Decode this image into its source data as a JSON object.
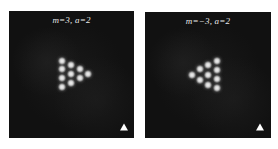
{
  "figure": {
    "panels": [
      {
        "id": "left",
        "label": "m=3,  a=2",
        "box": {
          "x": 9,
          "y": 11,
          "w": 125,
          "h": 127
        },
        "background": "#111111",
        "dots": [
          {
            "x": 62,
            "y": 61
          },
          {
            "x": 62,
            "y": 69
          },
          {
            "x": 62,
            "y": 78
          },
          {
            "x": 62,
            "y": 87
          },
          {
            "x": 71,
            "y": 65
          },
          {
            "x": 71,
            "y": 74
          },
          {
            "x": 71,
            "y": 83
          },
          {
            "x": 80,
            "y": 69
          },
          {
            "x": 80,
            "y": 78
          },
          {
            "x": 88,
            "y": 74
          }
        ],
        "marker": {
          "shape": "triangle-up",
          "x": 124,
          "y": 127,
          "color": "#ffffff"
        }
      },
      {
        "id": "right",
        "label": "m=−3,  a=2",
        "box": {
          "x": 145,
          "y": 12,
          "w": 126,
          "h": 126
        },
        "background": "#111111",
        "dots": [
          {
            "x": 192,
            "y": 75
          },
          {
            "x": 200,
            "y": 69
          },
          {
            "x": 200,
            "y": 80
          },
          {
            "x": 208,
            "y": 65
          },
          {
            "x": 208,
            "y": 75
          },
          {
            "x": 208,
            "y": 85
          },
          {
            "x": 217,
            "y": 61
          },
          {
            "x": 217,
            "y": 70
          },
          {
            "x": 217,
            "y": 79
          },
          {
            "x": 217,
            "y": 88
          }
        ],
        "marker": {
          "shape": "triangle-up",
          "x": 260,
          "y": 127,
          "color": "#ffffff"
        }
      }
    ]
  }
}
